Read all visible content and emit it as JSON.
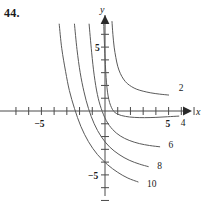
{
  "figure": {
    "problem_number": "44.",
    "background_color": "#ffffff",
    "ink_color": "#5a5a5a",
    "text_color": "#1a1a1a",
    "width": 208,
    "height": 203
  },
  "chart_data": {
    "type": "line",
    "title": "",
    "subtitle": "",
    "xlabel": "x",
    "ylabel": "y",
    "xlim": [
      -8.2,
      8.0
    ],
    "ylim": [
      -8.5,
      7.2
    ],
    "grid": false,
    "legend": "inline-curve-labels",
    "axis_labels": {
      "x": "x",
      "y": "y"
    },
    "x_ticks": [
      -7,
      -6,
      -5,
      -4,
      -3,
      -2,
      -1,
      1,
      2,
      3,
      4,
      5,
      6,
      7
    ],
    "x_tick_labels": [
      {
        "value": -5,
        "label": "-5"
      },
      {
        "value": 5,
        "label": "5"
      }
    ],
    "y_ticks": [
      -7,
      -6,
      -5,
      -4,
      -3,
      -2,
      -1,
      1,
      2,
      3,
      4,
      5,
      6
    ],
    "y_tick_labels": [
      {
        "value": 5,
        "label": "5"
      },
      {
        "value": -5,
        "label": "-5"
      }
    ],
    "series": [
      {
        "name": "2",
        "label": "2",
        "label_position": {
          "x": 5.8,
          "y": 1.6
        },
        "points": [
          [
            0.55,
            7.0
          ],
          [
            0.62,
            6.0
          ],
          [
            0.72,
            5.0
          ],
          [
            0.85,
            4.2
          ],
          [
            1.0,
            3.5
          ],
          [
            1.2,
            2.95
          ],
          [
            1.45,
            2.5
          ],
          [
            1.75,
            2.15
          ],
          [
            2.1,
            1.9
          ],
          [
            2.5,
            1.7
          ],
          [
            3.0,
            1.55
          ],
          [
            3.6,
            1.42
          ],
          [
            4.3,
            1.32
          ],
          [
            5.0,
            1.25
          ]
        ]
      },
      {
        "name": "4",
        "label": "4",
        "label_position": {
          "x": 5.95,
          "y": -1.15
        },
        "points": [
          [
            -0.1,
            6.8
          ],
          [
            0.0,
            4.2
          ],
          [
            0.12,
            2.2
          ],
          [
            0.3,
            0.9
          ],
          [
            0.6,
            0.1
          ],
          [
            1.0,
            -0.25
          ],
          [
            1.6,
            -0.42
          ],
          [
            2.3,
            -0.5
          ],
          [
            3.1,
            -0.52
          ],
          [
            4.0,
            -0.5
          ],
          [
            4.9,
            -0.45
          ],
          [
            5.8,
            -0.4
          ]
        ]
      },
      {
        "name": "6",
        "label": "6",
        "label_position": {
          "x": 5.0,
          "y": -2.9
        },
        "points": [
          [
            -1.25,
            6.8
          ],
          [
            -1.05,
            4.6
          ],
          [
            -0.85,
            2.8
          ],
          [
            -0.6,
            1.3
          ],
          [
            -0.3,
            0.2
          ],
          [
            0.1,
            -0.75
          ],
          [
            0.6,
            -1.45
          ],
          [
            1.2,
            -1.95
          ],
          [
            1.9,
            -2.3
          ],
          [
            2.7,
            -2.55
          ],
          [
            3.5,
            -2.7
          ],
          [
            4.3,
            -2.8
          ]
        ]
      },
      {
        "name": "8",
        "label": "8",
        "label_position": {
          "x": 4.1,
          "y": -4.5
        },
        "points": [
          [
            -2.4,
            6.8
          ],
          [
            -2.2,
            4.8
          ],
          [
            -1.95,
            3.0
          ],
          [
            -1.65,
            1.5
          ],
          [
            -1.3,
            0.2
          ],
          [
            -0.85,
            -1.0
          ],
          [
            -0.3,
            -2.0
          ],
          [
            0.35,
            -2.8
          ],
          [
            1.1,
            -3.4
          ],
          [
            1.9,
            -3.85
          ],
          [
            2.7,
            -4.15
          ],
          [
            3.4,
            -4.35
          ]
        ]
      },
      {
        "name": "10",
        "label": "10",
        "label_position": {
          "x": 3.3,
          "y": -5.95
        },
        "points": [
          [
            -3.6,
            6.8
          ],
          [
            -3.4,
            4.9
          ],
          [
            -3.1,
            3.1
          ],
          [
            -2.8,
            1.6
          ],
          [
            -2.4,
            0.2
          ],
          [
            -1.9,
            -1.2
          ],
          [
            -1.3,
            -2.4
          ],
          [
            -0.6,
            -3.4
          ],
          [
            0.2,
            -4.2
          ],
          [
            1.0,
            -4.8
          ],
          [
            1.8,
            -5.25
          ],
          [
            2.6,
            -5.55
          ]
        ]
      }
    ]
  }
}
